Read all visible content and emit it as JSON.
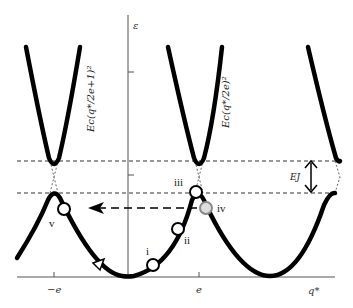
{
  "diagram": {
    "type": "energy-band-diagram",
    "axes": {
      "y_label": "ε",
      "x_label": "q*",
      "x_ticks": [
        {
          "label": "−e",
          "position": "-e"
        },
        {
          "label": "e",
          "position": "e"
        }
      ]
    },
    "curve_labels": {
      "upper_left": "Ec(q*/2e+1)²",
      "upper_middle": "Ec(q*/2e)²"
    },
    "gap_label": "EJ",
    "points": [
      {
        "id": "i",
        "label": "i"
      },
      {
        "id": "ii",
        "label": "ii"
      },
      {
        "id": "iii",
        "label": "iii"
      },
      {
        "id": "iv",
        "label": "iv"
      },
      {
        "id": "v",
        "label": "v"
      }
    ],
    "colors": {
      "curve": "#000000",
      "axis": "#555555",
      "dashed": "#333333",
      "point_fill": "#ffffff",
      "point_iv_stroke": "#888888"
    }
  }
}
